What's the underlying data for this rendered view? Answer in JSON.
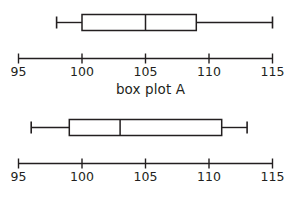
{
  "figure": {
    "background_color": "#ffffff",
    "stroke_color": "#231f20",
    "box_fill_color": "#ffffff"
  },
  "chart_data": [
    {
      "type": "box",
      "name": "box plot A",
      "title": "box plot A",
      "xlabel": "",
      "ylabel": "",
      "xlim": [
        95,
        115
      ],
      "grid": false,
      "legend": "none",
      "orientation": "horizontal",
      "ticks": [
        95,
        100,
        105,
        110,
        115
      ],
      "tick_labels": [
        "95",
        "100",
        "105",
        "110",
        "115"
      ],
      "stats": {
        "min": 98,
        "q1": 100,
        "median": 105,
        "q3": 109,
        "max": 115
      }
    },
    {
      "type": "box",
      "name": "box plot B",
      "title": "box plot B",
      "xlabel": "",
      "ylabel": "",
      "xlim": [
        95,
        115
      ],
      "grid": false,
      "legend": "none",
      "orientation": "horizontal",
      "ticks": [
        95,
        100,
        105,
        110,
        115
      ],
      "tick_labels": [
        "95",
        "100",
        "105",
        "110",
        "115"
      ],
      "stats": {
        "min": 96,
        "q1": 99,
        "median": 103,
        "q3": 111,
        "max": 113
      }
    }
  ],
  "panels": [
    {
      "caption": "box plot A"
    },
    {
      "caption": "box plot B"
    }
  ]
}
